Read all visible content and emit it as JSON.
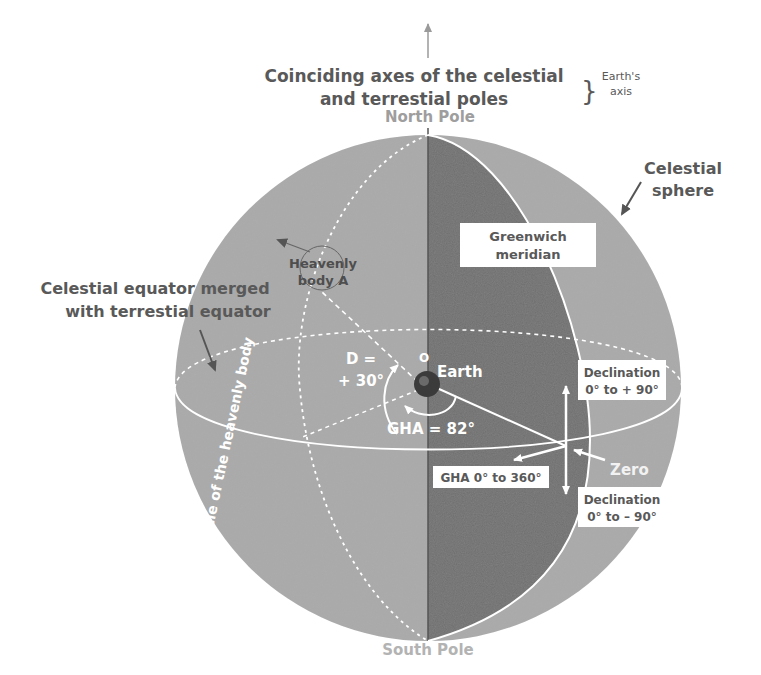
{
  "title": {
    "line1": "Coinciding axes of the celestial",
    "line2": "and terrestial poles",
    "bracket": "}",
    "aside_line1": "Earth's",
    "aside_line2": "axis"
  },
  "poles": {
    "north": "North Pole",
    "south": "South Pole"
  },
  "labels": {
    "celestial_sphere_line1": "Celestial",
    "celestial_sphere_line2": "sphere",
    "greenwich_line1": "Greenwich",
    "greenwich_line2": "meridian",
    "heavenly_line1": "Heavenly",
    "heavenly_line2": "body A",
    "equator_line1": "Celestial equator merged",
    "equator_line2": "with terrestial equator",
    "hour_circle": "Hour circle of the heavenly body",
    "origin": "O",
    "earth": "Earth",
    "d_line1": "D =",
    "d_line2": "+ 30°",
    "gha": "GHA = 82°",
    "decl_pos_line1": "Declination",
    "decl_pos_line2": "0° to + 90°",
    "decl_neg_line1": "Declination",
    "decl_neg_line2": "0° to – 90°",
    "gha_range": "GHA 0° to 360°",
    "zero": "Zero"
  },
  "colors": {
    "sphere_light": "#a9a9a9",
    "sphere_dark": "#6e6e6e",
    "text_dark": "#595959",
    "text_pale": "#9e9e9e",
    "line_white": "#ffffff"
  }
}
